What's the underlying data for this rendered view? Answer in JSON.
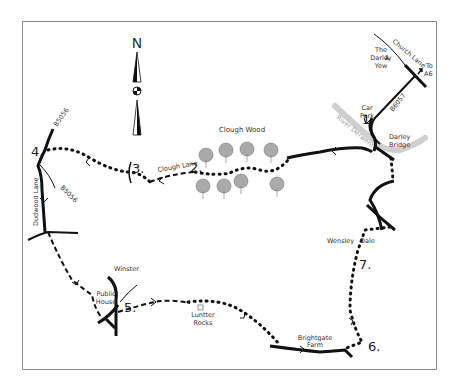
{
  "map": {
    "compass": {
      "label": "N"
    },
    "waypoints": [
      {
        "n": "1.",
        "x": 374,
        "y": 124
      },
      {
        "n": "2.",
        "x": 196,
        "y": 170
      },
      {
        "n": "3.",
        "x": 132,
        "y": 168
      },
      {
        "n": "4.",
        "x": 31,
        "y": 153
      },
      {
        "n": "5.",
        "x": 124,
        "y": 305
      },
      {
        "n": "6.",
        "x": 367,
        "y": 347
      },
      {
        "n": "7.",
        "x": 358,
        "y": 265
      }
    ],
    "labels": {
      "darley_yew": [
        "The",
        "Darley",
        "Yew"
      ],
      "church_lane": "Church Lane",
      "to_a6": [
        "To",
        "A6"
      ],
      "b6057": "B6057",
      "car_park": [
        "Car",
        "Park"
      ],
      "river": "River Derwent",
      "darley_bridge": [
        "Darley",
        "Bridge"
      ],
      "clough_wood": "Clough Wood",
      "clough_lane": "Clough Lane",
      "b5056_top": "B5056",
      "b5056_bottom": "B5056",
      "dudwood_lane": "Dudwood Lane",
      "winster": "Winster",
      "public_house": [
        "Public",
        "House"
      ],
      "luntter_rocks": [
        "Luntter",
        "Rocks"
      ],
      "brightgate_farm": [
        "Brightgate",
        "Farm"
      ],
      "wensley": "Wensley",
      "dale": "Dale"
    },
    "colors": {
      "border": "#888888",
      "road": "#111111",
      "river": "#cccccc",
      "path": "#111111"
    }
  }
}
